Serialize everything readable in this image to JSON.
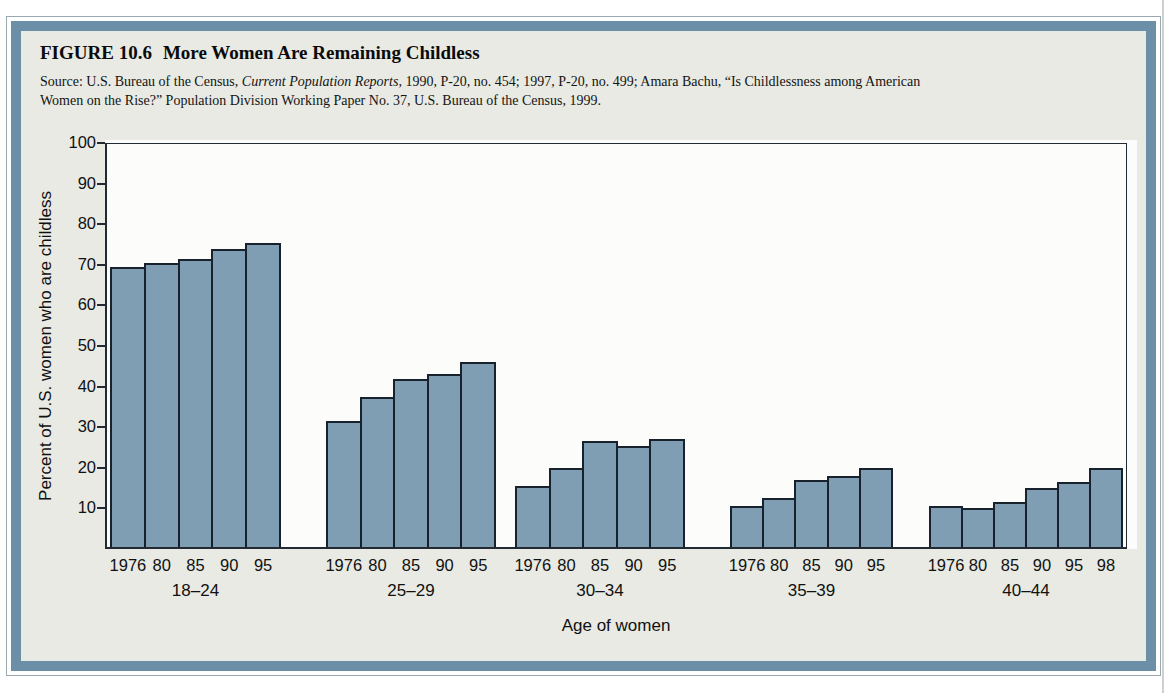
{
  "figure": {
    "label": "FIGURE 10.6",
    "title": "More Women Are Remaining Childless",
    "source": {
      "part1": "Source: U.S. Bureau of the Census, ",
      "italic": "Current Population Reports,",
      "part2": " 1990, P-20, no. 454; 1997, P-20, no. 499; Amara Bachu, “Is Childlessness among American",
      "part3": "Women on the Rise?” Population Division Working Paper No. 37, U.S. Bureau of the Census, 1999."
    }
  },
  "chart_data": {
    "type": "bar",
    "title": "More Women Are Remaining Childless",
    "xlabel": "Age of women",
    "ylabel": "Percent of U.S. women who are childless",
    "ylim": [
      0,
      100
    ],
    "yticks": [
      10,
      20,
      30,
      40,
      50,
      60,
      70,
      80,
      90,
      100
    ],
    "grid": false,
    "legend": "none",
    "bar_color": "#7f9db3",
    "bar_border_color": "#18222c",
    "groups": [
      {
        "label": "18–24",
        "years": [
          "1976",
          "80",
          "85",
          "90",
          "95"
        ],
        "values": [
          69,
          70,
          71,
          73.5,
          75
        ]
      },
      {
        "label": "25–29",
        "years": [
          "1976",
          "80",
          "85",
          "90",
          "95"
        ],
        "values": [
          31,
          37,
          41.5,
          42.5,
          45.5
        ]
      },
      {
        "label": "30–34",
        "years": [
          "1976",
          "80",
          "85",
          "90",
          "95"
        ],
        "values": [
          15,
          19.5,
          26,
          25,
          26.5
        ]
      },
      {
        "label": "35–39",
        "years": [
          "1976",
          "80",
          "85",
          "90",
          "95"
        ],
        "values": [
          10,
          12,
          16.5,
          17.5,
          19.5
        ]
      },
      {
        "label": "40–44",
        "years": [
          "1976",
          "80",
          "85",
          "90",
          "95",
          "98"
        ],
        "values": [
          10,
          9.5,
          11,
          14.5,
          16,
          19.5
        ]
      }
    ]
  },
  "colors": {
    "frame_band": "#6a8fa6",
    "figure_bg": "#e8eae3",
    "plot_bg": "#fcfdfa",
    "axis": "#222b33",
    "text": "#0e0e0e"
  }
}
